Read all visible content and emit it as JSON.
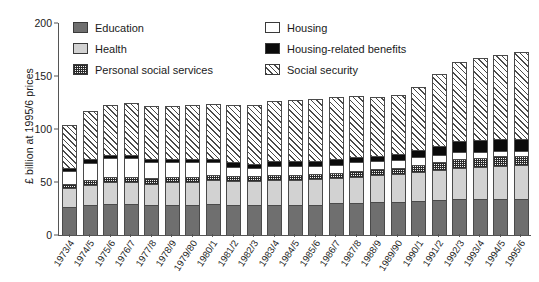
{
  "chart_data": {
    "type": "bar",
    "subtype": "stacked-bar",
    "title": "",
    "xlabel": "",
    "ylabel": "£ billion at 1995/6 prices",
    "ylim": [
      0,
      200
    ],
    "yticks": [
      0,
      50,
      100,
      150,
      200
    ],
    "grid": false,
    "legend_position": "top-inside",
    "categories": [
      "1973/4",
      "1974/5",
      "1975/6",
      "1976/7",
      "1977/8",
      "1978/9",
      "1979/80",
      "1980/1",
      "1981/2",
      "1982/3",
      "1983/4",
      "1984/5",
      "1985/6",
      "1986/7",
      "1987/8",
      "1988/9",
      "1989/90",
      "1990/1",
      "1991/2",
      "1992/3",
      "1993/4",
      "1994/5",
      "1995/6"
    ],
    "series": [
      {
        "name": "Education",
        "color": "#6f6f6f",
        "pattern": "solid-dark-grey",
        "values": [
          26,
          28,
          29,
          29,
          28,
          28,
          28,
          29,
          28,
          28,
          28,
          28,
          28,
          29,
          29,
          30,
          30,
          31,
          32,
          33,
          33,
          33,
          33
        ]
      },
      {
        "name": "Health",
        "color": "#d2d2d2",
        "pattern": "solid-light-grey",
        "values": [
          18,
          19,
          20,
          20,
          20,
          21,
          21,
          22,
          22,
          22,
          23,
          23,
          24,
          24,
          25,
          26,
          27,
          28,
          29,
          30,
          31,
          32,
          32
        ]
      },
      {
        "name": "Personal social services",
        "color": "#f2f2f2",
        "pattern": "fine-dotted-grid",
        "values": [
          4,
          4,
          5,
          5,
          5,
          5,
          5,
          5,
          5,
          5,
          5,
          5,
          5,
          5,
          6,
          6,
          6,
          7,
          7,
          8,
          8,
          9,
          9
        ]
      },
      {
        "name": "Housing",
        "color": "#ffffff",
        "pattern": "white",
        "values": [
          12,
          17,
          18,
          18,
          15,
          14,
          14,
          12,
          9,
          8,
          9,
          9,
          8,
          8,
          8,
          7,
          7,
          7,
          7,
          7,
          6,
          5,
          5
        ]
      },
      {
        "name": "Housing-related benefits",
        "color": "#0b0b0b",
        "pattern": "solid-black",
        "values": [
          3,
          3,
          3,
          3,
          3,
          3,
          3,
          3,
          4,
          4,
          4,
          4,
          4,
          5,
          5,
          5,
          6,
          7,
          9,
          10,
          11,
          11,
          11
        ]
      },
      {
        "name": "Social security",
        "color": "#ffffff",
        "pattern": "diagonal-hatch",
        "values": [
          41,
          46,
          48,
          50,
          51,
          51,
          52,
          53,
          55,
          56,
          57,
          58,
          59,
          59,
          58,
          56,
          56,
          60,
          68,
          75,
          78,
          80,
          83
        ]
      }
    ],
    "totals": [
      104,
      117,
      123,
      125,
      122,
      122,
      123,
      124,
      123,
      123,
      126,
      127,
      128,
      130,
      131,
      130,
      132,
      140,
      152,
      163,
      167,
      170,
      173
    ]
  },
  "legend": {
    "items": [
      {
        "label": "Education",
        "swatch": "education-swatch"
      },
      {
        "label": "Housing",
        "swatch": "housing-swatch"
      },
      {
        "label": "Health",
        "swatch": "health-swatch"
      },
      {
        "label": "Housing-related benefits",
        "swatch": "housing-related-benefits-swatch"
      },
      {
        "label": "Personal social services",
        "swatch": "personal-social-services-swatch"
      },
      {
        "label": "Social security",
        "swatch": "social-security-swatch"
      }
    ]
  },
  "axes": {
    "y_title": "£ billion at 1995/6 prices",
    "y_tick_labels": [
      "200",
      "150",
      "100",
      "50",
      "0"
    ]
  }
}
